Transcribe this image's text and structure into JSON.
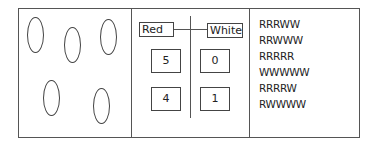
{
  "panel_left": {
    "ovals": [
      {
        "x": 27,
        "y": 17
      },
      {
        "x": 64,
        "y": 27
      },
      {
        "x": 100,
        "y": 19
      },
      {
        "x": 43,
        "y": 80
      },
      {
        "x": 93,
        "y": 88
      }
    ]
  },
  "panel_middle": {
    "left_label": "Red",
    "right_label": "White",
    "rows": [
      {
        "red": "5",
        "white": "0"
      },
      {
        "red": "4",
        "white": "1"
      }
    ]
  },
  "panel_right": {
    "sequences": [
      "RRRWW",
      "RRWWW",
      "RRRRR",
      "WWWWW",
      "RRRRW",
      "RWWWW"
    ]
  }
}
